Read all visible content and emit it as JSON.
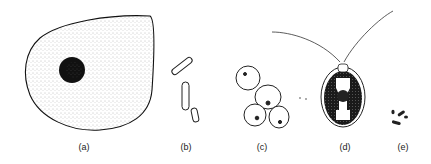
{
  "figure": {
    "panels": [
      {
        "id": "a",
        "label": "(a)",
        "subject": "large cell with nucleus",
        "label_x": 84,
        "label_y": 147
      },
      {
        "id": "b",
        "label": "(b)",
        "subject": "rod-shaped bacteria",
        "label_x": 186,
        "label_y": 147
      },
      {
        "id": "c",
        "label": "(c)",
        "subject": "budding yeast cells",
        "label_x": 262,
        "label_y": 147
      },
      {
        "id": "d",
        "label": "(d)",
        "subject": "biflagellate green alga",
        "label_x": 345,
        "label_y": 147
      },
      {
        "id": "e",
        "label": "(e)",
        "subject": "small bacteria",
        "label_x": 398,
        "label_y": 147
      }
    ]
  }
}
